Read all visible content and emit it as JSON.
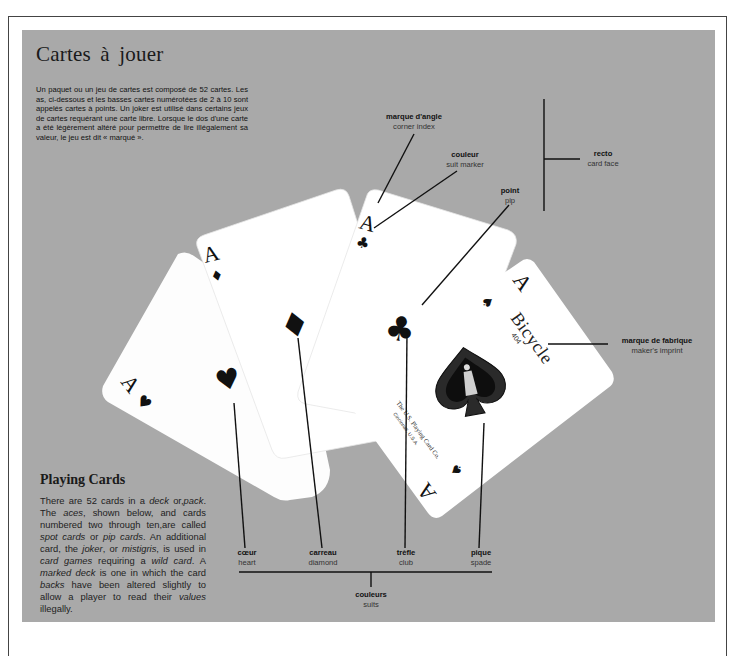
{
  "french": {
    "title": "Cartes à jouer",
    "body": "Un paquet ou un jeu de cartes est composé de 52 cartes. Les as, ci-dessous et les basses cartes numérotées de 2 à 10 sont appelés cartes à points. Un joker est utilisé dans certains jeux de cartes requérant une carte libre. Lorsque le dos d'une carte a été légèrement altéré pour permettre de lire illégalement sa valeur, le jeu est dit « marqué »."
  },
  "english": {
    "title": "Playing Cards",
    "segments": [
      {
        "t": "There are 52 cards in a ",
        "i": false
      },
      {
        "t": "deck",
        "i": true
      },
      {
        "t": " or,",
        "i": false
      },
      {
        "t": "pack",
        "i": true
      },
      {
        "t": ". The ",
        "i": false
      },
      {
        "t": "aces",
        "i": true
      },
      {
        "t": ", shown below, and cards numbered two through ten,are called ",
        "i": false
      },
      {
        "t": "spot cards",
        "i": true
      },
      {
        "t": " or ",
        "i": false
      },
      {
        "t": "pip cards",
        "i": true
      },
      {
        "t": ". An additional card, the ",
        "i": false
      },
      {
        "t": "joker",
        "i": true
      },
      {
        "t": ", or ",
        "i": false
      },
      {
        "t": "mistigris",
        "i": true
      },
      {
        "t": ", is used in ",
        "i": false
      },
      {
        "t": "card games",
        "i": true
      },
      {
        "t": " requiring a ",
        "i": false
      },
      {
        "t": "wild card",
        "i": true
      },
      {
        "t": ". A ",
        "i": false
      },
      {
        "t": "marked deck",
        "i": true
      },
      {
        "t": " is one in which the card ",
        "i": false
      },
      {
        "t": "backs",
        "i": true
      },
      {
        "t": " have been altered slightly to allow a player to read their ",
        "i": false
      },
      {
        "t": "values",
        "i": true
      },
      {
        "t": " illegally.",
        "i": false
      }
    ]
  },
  "labels": {
    "corner_index": {
      "fr": "marque d'angle",
      "en": "corner index"
    },
    "suit_marker": {
      "fr": "couleur",
      "en": "suit marker"
    },
    "pip": {
      "fr": "point",
      "en": "pip"
    },
    "card_face": {
      "fr": "recto",
      "en": "card face"
    },
    "makers_imprint": {
      "fr": "marque de fabrique",
      "en": "maker's imprint"
    },
    "heart": {
      "fr": "cœur",
      "en": "heart"
    },
    "diamond": {
      "fr": "carreau",
      "en": "diamond"
    },
    "club": {
      "fr": "trèfle",
      "en": "club"
    },
    "spade": {
      "fr": "pique",
      "en": "spade"
    },
    "suits": {
      "fr": "couleurs",
      "en": "suits"
    }
  },
  "cards": {
    "rank": "A",
    "suit_glyphs": {
      "heart": "♥",
      "diamond": "♦",
      "club": "♣",
      "spade": "♠"
    },
    "brand": "Bicycle",
    "brand_number": "404",
    "manufacturer": "The U.S. Playing Card Co.",
    "manufacturer_city": "Cincinnati, U.S.A."
  },
  "colors": {
    "panel": "#a9a9a9",
    "card": "#ffffff",
    "ink": "#111111"
  }
}
